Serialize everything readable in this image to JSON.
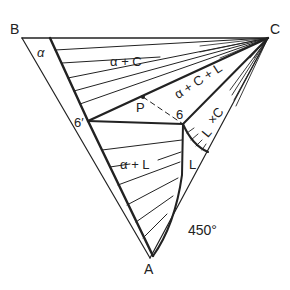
{
  "diagram": {
    "temperature_label": "450°",
    "vertices": {
      "A": "A",
      "B": "B",
      "C": "C"
    },
    "regions": {
      "alpha": "α",
      "alpha_c": "α + C",
      "alpha_c_l": "α + C + L",
      "l_c": "L + C",
      "l_c_top": "×C",
      "l_c_bottom": "L",
      "alpha_l": "α + L",
      "liquid": "L"
    },
    "points": {
      "p": "P",
      "six": "6",
      "six_prime": "6′"
    }
  }
}
